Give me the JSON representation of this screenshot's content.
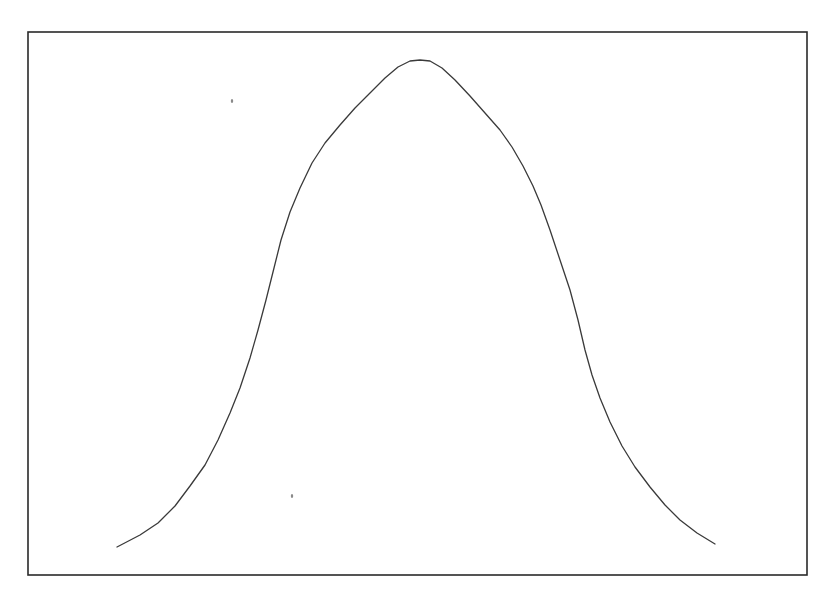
{
  "figure": {
    "frame": {
      "x1": 28,
      "y1": 32,
      "x2": 807,
      "y2": 575,
      "color": "#2a2a2a"
    },
    "curve_color": "#3a3a3a",
    "curve_points": [
      [
        117,
        547
      ],
      [
        140,
        535
      ],
      [
        158,
        523
      ],
      [
        175,
        506
      ],
      [
        190,
        486
      ],
      [
        205,
        465
      ],
      [
        218,
        440
      ],
      [
        230,
        413
      ],
      [
        240,
        388
      ],
      [
        250,
        358
      ],
      [
        258,
        330
      ],
      [
        266,
        300
      ],
      [
        274,
        268
      ],
      [
        281,
        240
      ],
      [
        290,
        212
      ],
      [
        300,
        188
      ],
      [
        312,
        163
      ],
      [
        325,
        143
      ],
      [
        340,
        125
      ],
      [
        355,
        108
      ],
      [
        370,
        93
      ],
      [
        385,
        78
      ],
      [
        398,
        67
      ],
      [
        410,
        61
      ],
      [
        420,
        60
      ],
      [
        430,
        61
      ],
      [
        442,
        68
      ],
      [
        455,
        80
      ],
      [
        470,
        96
      ],
      [
        485,
        113
      ],
      [
        500,
        130
      ],
      [
        512,
        147
      ],
      [
        523,
        166
      ],
      [
        533,
        186
      ],
      [
        541,
        205
      ],
      [
        550,
        230
      ],
      [
        560,
        260
      ],
      [
        570,
        290
      ],
      [
        578,
        320
      ],
      [
        585,
        350
      ],
      [
        592,
        375
      ],
      [
        600,
        398
      ],
      [
        610,
        422
      ],
      [
        622,
        446
      ],
      [
        635,
        467
      ],
      [
        650,
        487
      ],
      [
        665,
        505
      ],
      [
        680,
        520
      ],
      [
        697,
        533
      ],
      [
        715,
        544
      ]
    ],
    "specks": [
      {
        "x": 232,
        "y": 101
      },
      {
        "x": 292,
        "y": 496
      }
    ]
  }
}
